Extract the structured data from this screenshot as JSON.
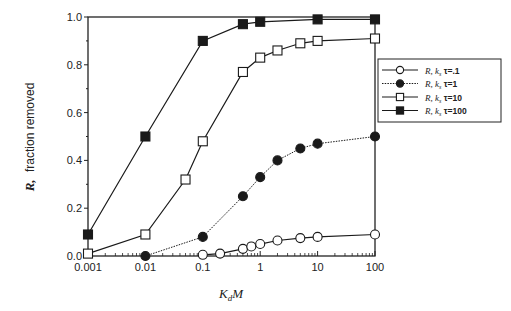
{
  "chart_data": {
    "type": "line",
    "title": "",
    "xlabel": "K_dM",
    "ylabel": "R, fraction removed",
    "xscale": "log",
    "xlim": [
      0.001,
      100
    ],
    "ylim": [
      0.0,
      1.0
    ],
    "xticks": [
      "0.001",
      "0.01",
      "0.1",
      "1",
      "10",
      "100"
    ],
    "yticks": [
      "0.0",
      "0.2",
      "0.4",
      "0.6",
      "0.8",
      "1.0"
    ],
    "grid": false,
    "legend_position": "right, outside plot",
    "series": [
      {
        "name": "R, k_s τ=.1",
        "marker": "open-circle",
        "line": "solid",
        "x": [
          0.1,
          0.2,
          0.5,
          0.7,
          1,
          2,
          5,
          10,
          100
        ],
        "y": [
          0.005,
          0.01,
          0.03,
          0.04,
          0.05,
          0.065,
          0.075,
          0.08,
          0.09
        ]
      },
      {
        "name": "R, k_s τ=1",
        "marker": "filled-circle",
        "line": "dotted",
        "x": [
          0.01,
          0.1,
          0.5,
          1,
          2,
          5,
          10,
          100
        ],
        "y": [
          0.0,
          0.08,
          0.25,
          0.33,
          0.4,
          0.45,
          0.47,
          0.5
        ]
      },
      {
        "name": "R, k_s τ=10",
        "marker": "open-square",
        "line": "solid",
        "x": [
          0.001,
          0.01,
          0.05,
          0.1,
          0.5,
          1,
          2,
          5,
          10,
          100
        ],
        "y": [
          0.01,
          0.09,
          0.32,
          0.48,
          0.77,
          0.83,
          0.86,
          0.89,
          0.9,
          0.91
        ]
      },
      {
        "name": "R, k_s τ=100",
        "marker": "filled-square",
        "line": "solid",
        "x": [
          0.001,
          0.01,
          0.1,
          0.5,
          1,
          10,
          100
        ],
        "y": [
          0.09,
          0.5,
          0.9,
          0.97,
          0.98,
          0.99,
          0.99
        ]
      }
    ]
  },
  "labels": {
    "xlabel_main": "K",
    "xlabel_sub": "d",
    "xlabel_tail": "M",
    "ylabel_italic": "R,",
    "ylabel_rest": "fraction removed"
  },
  "legend": [
    {
      "prefix": "R,",
      "k": "k",
      "sub": "s",
      "rest": "τ=.1"
    },
    {
      "prefix": "R,",
      "k": "k",
      "sub": "s",
      "rest": "τ=1"
    },
    {
      "prefix": "R,",
      "k": "k",
      "sub": "s",
      "rest": "τ=10"
    },
    {
      "prefix": "R,",
      "k": "k",
      "sub": "s",
      "rest": "τ=100"
    }
  ]
}
